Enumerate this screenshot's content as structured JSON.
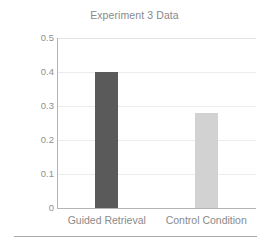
{
  "chart_data": {
    "type": "bar",
    "title": "Experiment 3 Data",
    "xlabel": "",
    "ylabel": "Assessment Performance",
    "categories": [
      "Guided Retrieval",
      "Control Condition"
    ],
    "values": [
      0.4,
      0.28
    ],
    "ylim": [
      0,
      0.5
    ],
    "yticks": [
      "0",
      "0.1",
      "0.2",
      "0.3",
      "0.4",
      "0.5"
    ],
    "ytick_values": [
      0,
      0.1,
      0.2,
      0.3,
      0.4,
      0.5
    ],
    "grid": true,
    "legend": false,
    "bar_colors": [
      "#5a5a5a",
      "#d2d2d2"
    ],
    "bars": [
      {
        "category": "Guided Retrieval",
        "value": 0.4,
        "color": "#5a5a5a"
      },
      {
        "category": "Control Condition",
        "value": 0.28,
        "color": "#d2d2d2"
      }
    ]
  },
  "figure": {
    "background": "#ffffff",
    "axis_color": "#b4b4b4",
    "grid_color": "#ececec",
    "text_color": "#8a8a8a"
  }
}
